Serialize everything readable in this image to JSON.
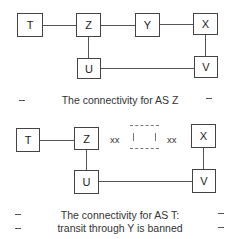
{
  "top_diagram": {
    "nodes": {
      "T": "T",
      "Z": "Z",
      "Y": "Y",
      "X": "X",
      "U": "U",
      "V": "V"
    },
    "caption": "The connectivity for AS Z"
  },
  "bottom_diagram": {
    "nodes": {
      "T": "T",
      "Z": "Z",
      "X": "X",
      "U": "U",
      "V": "V"
    },
    "blocked_left": "xx",
    "blocked_right": "xx",
    "caption_line1": "The connectivity for AS T:",
    "caption_line2": "transit through Y is banned"
  }
}
